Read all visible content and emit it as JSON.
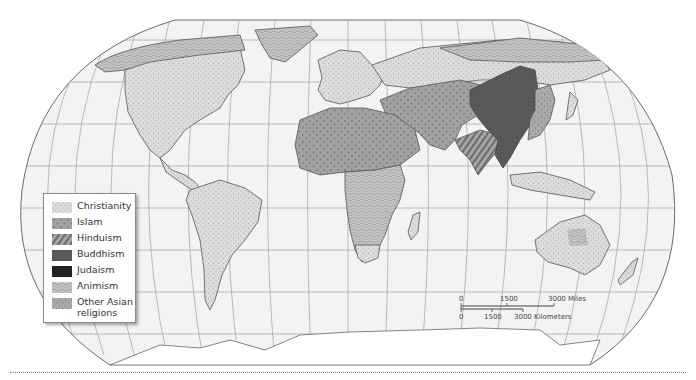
{
  "map": {
    "title": "World Religions",
    "projection": "Robinson",
    "colors": {
      "ocean": "#f2f2f2",
      "graticule": "#9a9a9a",
      "border": "#555555",
      "christianity": "#d9d9d9",
      "islam": "#9c9c9c",
      "hinduism": "#8e8e8e",
      "buddhism": "#5c5c5c",
      "judaism": "#222222",
      "animism": "#bdbdbd",
      "other_asian": "#a5a5a5"
    }
  },
  "legend": {
    "items": [
      {
        "label": "Christianity",
        "pattern": "fine-dots",
        "color": "#d9d9d9"
      },
      {
        "label": "Islam",
        "pattern": "large-dots",
        "color": "#9c9c9c"
      },
      {
        "label": "Hinduism",
        "pattern": "diagonal-stripes",
        "color": "#8e8e8e"
      },
      {
        "label": "Buddhism",
        "pattern": "dark-texture",
        "color": "#5c5c5c"
      },
      {
        "label": "Judaism",
        "pattern": "solid-black",
        "color": "#222222"
      },
      {
        "label": "Animism",
        "pattern": "wavy-lines",
        "color": "#bdbdbd"
      },
      {
        "label": "Other Asian religions",
        "label_line1": "Other Asian",
        "label_line2": "religions",
        "pattern": "scattered-dots",
        "color": "#a5a5a5"
      }
    ]
  },
  "scale_bar": {
    "miles": {
      "ticks": [
        "0",
        "1500",
        "3000 Miles"
      ]
    },
    "kilometers": {
      "ticks": [
        "0",
        "1500",
        "3000 Kilometers"
      ]
    }
  }
}
